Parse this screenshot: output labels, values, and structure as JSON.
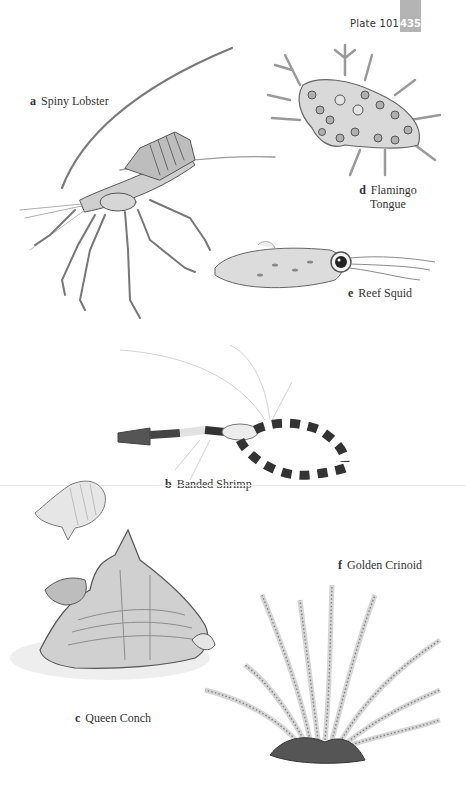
{
  "header": {
    "plate_label": "Plate 101",
    "page_number": "435",
    "tab_color": "#b4b4b4"
  },
  "species": [
    {
      "letter": "a",
      "name": "Spiny Lobster",
      "icon": "spiny-lobster-illustration"
    },
    {
      "letter": "b",
      "name": "Banded Shrimp",
      "icon": "banded-shrimp-illustration"
    },
    {
      "letter": "c",
      "name": "Queen Conch",
      "icon": "queen-conch-illustration"
    },
    {
      "letter": "d",
      "name_line1": "Flamingo",
      "name_line2": "Tongue",
      "icon": "flamingo-tongue-illustration"
    },
    {
      "letter": "e",
      "name": "Reef Squid",
      "icon": "reef-squid-illustration"
    },
    {
      "letter": "f",
      "name": "Golden Crinoid",
      "icon": "golden-crinoid-illustration"
    }
  ]
}
